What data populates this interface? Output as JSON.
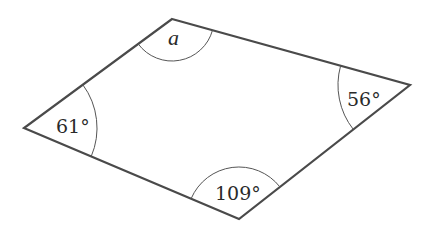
{
  "diagram": {
    "type": "quadrilateral",
    "stroke_color": "#4a4a4a",
    "vertices": {
      "top": {
        "x": 172,
        "y": 19
      },
      "right": {
        "x": 410,
        "y": 85
      },
      "bottom": {
        "x": 239,
        "y": 219
      },
      "left": {
        "x": 24,
        "y": 128
      }
    },
    "angles": {
      "top": {
        "label": "a",
        "unknown": true
      },
      "right": {
        "label": "56°",
        "value": 56
      },
      "bottom": {
        "label": "109°",
        "value": 109
      },
      "left": {
        "label": "61°",
        "value": 61
      }
    }
  }
}
